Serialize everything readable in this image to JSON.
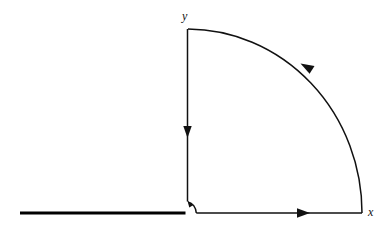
{
  "figure": {
    "kind": "contour-integration-diagram",
    "background_color": "#ffffff",
    "stroke_color": "#111111",
    "thick_stroke_color": "#000000",
    "canvas": {
      "width": 389,
      "height": 232
    }
  },
  "axes": {
    "origin": {
      "x": 187,
      "y": 213
    },
    "y_label": "y",
    "x_label": "x",
    "y_label_position": {
      "x": 182,
      "y": 10
    },
    "x_label_position": {
      "x": 368,
      "y": 206
    }
  },
  "geometry": {
    "radius_x": 175,
    "radius_y": 184,
    "arc_top": {
      "x": 188,
      "y": 29
    },
    "arc_right": {
      "x": 362,
      "y": 213
    },
    "small_arc_radius": 9,
    "branch_cut": {
      "x_start": 20,
      "x_end": 185,
      "y": 213,
      "width": 3
    }
  },
  "segments": [
    {
      "name": "vertical-descent",
      "label": "y-axis segment",
      "from": {
        "x": 187,
        "y": 29
      },
      "to": {
        "x": 187,
        "y": 201
      },
      "direction": "down",
      "arrow_at": {
        "x": 187,
        "y": 133
      }
    },
    {
      "name": "small-indentation-arc",
      "label": "small quarter arc around origin",
      "from": {
        "x": 196,
        "y": 213
      },
      "to": {
        "x": 188,
        "y": 202
      },
      "direction": "counterclockwise-inward",
      "arrow_at": {
        "x": 189,
        "y": 203
      }
    },
    {
      "name": "horizontal-outward",
      "label": "positive real axis segment",
      "from": {
        "x": 196,
        "y": 213
      },
      "to": {
        "x": 362,
        "y": 213
      },
      "direction": "right",
      "arrow_at": {
        "x": 304,
        "y": 213
      }
    },
    {
      "name": "large-quarter-arc",
      "label": "large quarter circle of radius R",
      "from": {
        "x": 362,
        "y": 213
      },
      "to": {
        "x": 188,
        "y": 29
      },
      "direction": "counterclockwise",
      "arrow_at": {
        "x": 306,
        "y": 68
      }
    },
    {
      "name": "branch-cut",
      "label": "branch cut along negative real axis",
      "from": {
        "x": 20,
        "y": 213
      },
      "to": {
        "x": 185,
        "y": 213
      },
      "direction": "none",
      "arrow_at": null
    }
  ],
  "arrows": [
    {
      "name": "arrow-down-y-axis",
      "direction": "down"
    },
    {
      "name": "arrow-up-small-arc",
      "direction": "up-left"
    },
    {
      "name": "arrow-right-x-axis",
      "direction": "right"
    },
    {
      "name": "arrow-ccw-large-arc",
      "direction": "up-left"
    }
  ]
}
